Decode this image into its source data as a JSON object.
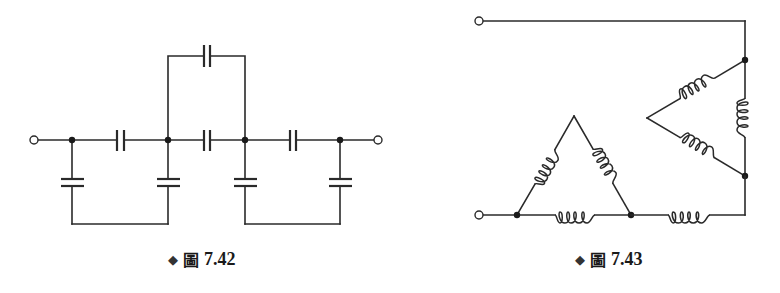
{
  "figures": [
    {
      "id": "fig-7-42",
      "caption": {
        "bullet": "◆",
        "label": "圖",
        "number": "7.42"
      },
      "components": {
        "capacitors": 7,
        "terminals": 2,
        "junctions": 4
      },
      "description": "Capacitor ladder network: two series capacitors plus a bridging capacitor, four shunt capacitors"
    },
    {
      "id": "fig-7-43",
      "caption": {
        "bullet": "◆",
        "label": "圖",
        "number": "7.43"
      },
      "components": {
        "inductors": 7,
        "terminals": 2,
        "junctions": 4
      },
      "description": "Two delta-connected inductor networks joined with a series inductor"
    }
  ],
  "colors": {
    "line": "#2a2a2a",
    "node": "#1a1a1a",
    "background": "#ffffff"
  }
}
